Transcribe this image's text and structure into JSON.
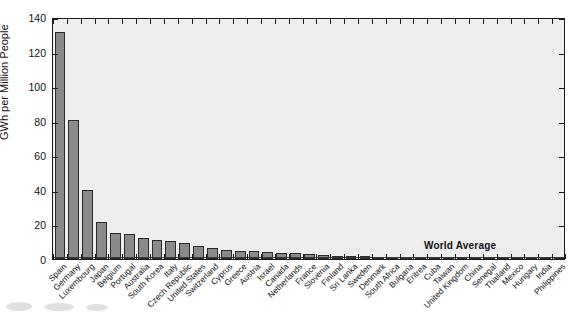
{
  "chart_data": {
    "type": "bar",
    "title": "",
    "xlabel": "",
    "ylabel": "GWh per Million People",
    "ylim": [
      0,
      140
    ],
    "yticks": [
      0,
      20,
      40,
      60,
      80,
      100,
      120,
      140
    ],
    "grid": false,
    "legend": null,
    "annotations": [
      {
        "text": "World Average",
        "value": 2.5,
        "type": "reference-line"
      }
    ],
    "categories": [
      "Spain",
      "Germany",
      "Luxembourg",
      "Japan",
      "Belgium",
      "Portugal",
      "Australia",
      "South Korea",
      "Italy",
      "Czech Republic",
      "United States",
      "Switzerland",
      "Cyprus",
      "Greece",
      "Austria",
      "Israel",
      "Canada",
      "Netherlands",
      "France",
      "Slovenia",
      "Finland",
      "Sri Lanka",
      "Sweden",
      "Denmark",
      "South Africa",
      "Bulgaria",
      "Eritrea",
      "Cuba",
      "Taiwan",
      "United Kingdom",
      "China",
      "Senegal",
      "Thailand",
      "Mexico",
      "Hungary",
      "India",
      "Philippines"
    ],
    "values": [
      131.5,
      80.3,
      39.8,
      21.4,
      15.0,
      14.7,
      12.0,
      11.1,
      10.4,
      9.0,
      7.7,
      6.6,
      5.4,
      4.9,
      4.6,
      4.2,
      3.7,
      3.4,
      2.9,
      2.6,
      2.0,
      1.7,
      1.5,
      1.3,
      1.2,
      1.1,
      1.0,
      0.9,
      0.8,
      0.7,
      0.6,
      0.55,
      0.5,
      0.45,
      0.4,
      0.3,
      0.25
    ],
    "units": "GWh per Million People",
    "bar_color": "#8a8a8a",
    "bar_edge_color": "#2b2b2b",
    "plot_background": "#eeeeee",
    "axis_color": "#1a1a1a"
  }
}
